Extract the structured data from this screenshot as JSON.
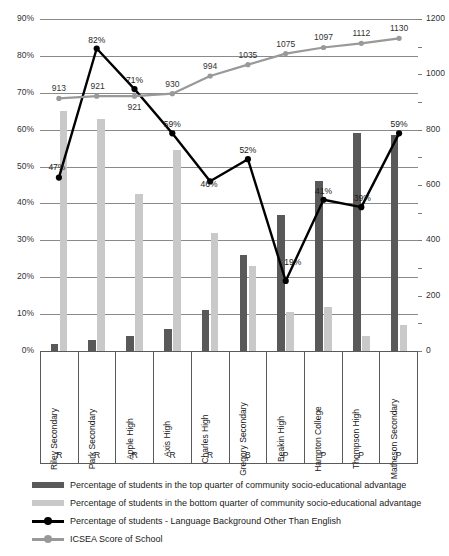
{
  "chart_data": {
    "type": "bar",
    "title": "",
    "xlabel": "",
    "ylabel": "",
    "ylim": [
      0,
      90
    ],
    "y2lim": [
      0,
      1200
    ],
    "grid": true,
    "legend_position": "bottom",
    "categories": [
      "Riley Secondary",
      "Park Secondary",
      "Apple High",
      "Axis High",
      "Charles High",
      "Gregory Secondary",
      "Beakin High",
      "Hampton College",
      "Thompson High",
      "Matheson Secondary"
    ],
    "category_ranks": [
      "R",
      "R",
      "R",
      "R",
      "R",
      "B",
      "P",
      "P",
      "P",
      "P"
    ],
    "left_ticks": [
      "0%",
      "10%",
      "20%",
      "30%",
      "40%",
      "50%",
      "60%",
      "70%",
      "80%",
      "90%"
    ],
    "right_ticks": [
      "0",
      "200",
      "400",
      "600",
      "800",
      "1000",
      "1200"
    ],
    "series": [
      {
        "name": "Percentage of students in the top quarter of community socio-educational advantage",
        "type": "bar",
        "axis": "left",
        "color": "#595959",
        "values": [
          2,
          3,
          4,
          6,
          11,
          26,
          37,
          46,
          59,
          58.5
        ],
        "labels": [
          "",
          "",
          "",
          "",
          "",
          "",
          "",
          "",
          "",
          ""
        ]
      },
      {
        "name": "Percentage of students in the bottom quarter of community socio-educational advantage",
        "type": "bar",
        "axis": "left",
        "color": "#c9c9c9",
        "values": [
          65,
          63,
          42.5,
          54.5,
          32,
          23,
          10.5,
          12,
          4,
          7
        ],
        "labels": [
          "",
          "",
          "",
          "",
          "",
          "",
          "",
          "",
          "",
          ""
        ]
      },
      {
        "name": "Percentage of students - Language Background Other Than English",
        "type": "line",
        "axis": "left",
        "color": "#000000",
        "values": [
          47,
          82,
          71,
          59,
          46,
          52,
          19,
          41,
          39,
          59
        ],
        "labels": [
          "47%",
          "82%",
          "71%",
          "59%",
          "46%",
          "52%",
          "19%",
          "41%",
          "39%",
          "59%"
        ]
      },
      {
        "name": "ICSEA Score of School",
        "type": "line",
        "axis": "right",
        "color": "#999999",
        "values": [
          913,
          921,
          921,
          930,
          994,
          1035,
          1075,
          1097,
          1112,
          1130
        ],
        "labels": [
          "913",
          "921",
          "921",
          "930",
          "994",
          "1035",
          "1075",
          "1097",
          "1112",
          "1130"
        ]
      }
    ]
  },
  "legend": {
    "items": [
      {
        "label": "Percentage of students in the top quarter of community socio-educational advantage",
        "style": "swatch",
        "color": "#595959"
      },
      {
        "label": "Percentage of students in the bottom quarter of community socio-educational advantage",
        "style": "swatch",
        "color": "#c9c9c9"
      },
      {
        "label": "Percentage of students - Language Background Other Than English",
        "style": "line-marker",
        "color": "#000000"
      },
      {
        "label": "ICSEA Score of School",
        "style": "line-marker",
        "color": "#999999"
      }
    ]
  }
}
